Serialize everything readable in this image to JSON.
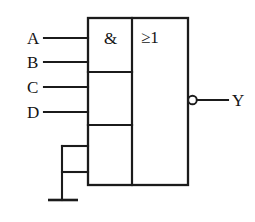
{
  "diagram": {
    "background_color": "#ffffff",
    "line_color": "#1b1b1b"
  },
  "block": {
    "and_symbol": "&",
    "or_symbol": "≥1",
    "and_symbol_name": "and-gate-symbol",
    "or_symbol_name": "or-gate-symbol"
  },
  "inputs": [
    {
      "label": "A",
      "y": 38
    },
    {
      "label": "B",
      "y": 62
    },
    {
      "label": "C",
      "y": 87
    },
    {
      "label": "D",
      "y": 112
    }
  ],
  "outputs": [
    {
      "label": "Y",
      "y": 100,
      "inverted": "true"
    }
  ],
  "ground": {
    "label": "",
    "branch_count": 2,
    "branch_y": [
      146,
      172
    ]
  }
}
